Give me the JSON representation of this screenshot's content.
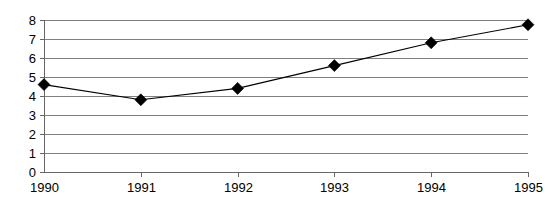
{
  "chart_data": {
    "type": "line",
    "title": "",
    "subtitle": "",
    "xlabel": "",
    "ylabel": "",
    "categories": [
      "1990",
      "1991",
      "1992",
      "1993",
      "1994",
      "1995"
    ],
    "x": [
      1990,
      1991,
      1992,
      1993,
      1994,
      1995
    ],
    "values": [
      4.6,
      3.8,
      4.4,
      5.6,
      6.8,
      7.75
    ],
    "series": [
      {
        "name": "",
        "values": [
          4.6,
          3.8,
          4.4,
          5.6,
          6.8,
          7.75
        ],
        "marker": "diamond",
        "marker_color": "#000000",
        "line_color": "#000000"
      }
    ],
    "ylim": [
      0,
      8
    ],
    "xlim": [
      1990,
      1995
    ],
    "yticks": [
      0,
      1,
      2,
      3,
      4,
      5,
      6,
      7,
      8
    ],
    "ytick_labels": [
      "0",
      "1",
      "2",
      "3",
      "4",
      "5",
      "6",
      "7",
      "8"
    ],
    "xticks": [
      1990,
      1991,
      1992,
      1993,
      1994,
      1995
    ],
    "xtick_labels": [
      "1990",
      "1991",
      "1992",
      "1993",
      "1994",
      "1995"
    ],
    "grid": true,
    "grid_axis": "y",
    "grid_color": "#808080",
    "legend": false,
    "legend_position": "none",
    "background_color": "#ffffff",
    "annotations": []
  },
  "layout": {
    "plot_left": 44,
    "plot_right": 528,
    "plot_top": 20,
    "plot_bottom": 172
  }
}
